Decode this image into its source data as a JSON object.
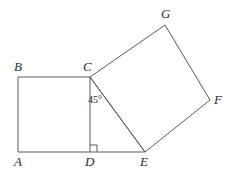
{
  "figure": {
    "background_color": "#ffffff",
    "stroke_color": "#5a5a5a",
    "label_color": "#2b2b2b",
    "stroke_width": 1,
    "canvas": {
      "width": 241,
      "height": 174
    },
    "vertices": [
      {
        "id": "A",
        "label": "A",
        "x": 18,
        "y": 152,
        "label_x": 14,
        "label_y": 155
      },
      {
        "id": "B",
        "label": "B",
        "x": 18,
        "y": 77,
        "label_x": 14,
        "label_y": 60
      },
      {
        "id": "C",
        "label": "C",
        "x": 90,
        "y": 77,
        "label_x": 83,
        "label_y": 60
      },
      {
        "id": "D",
        "label": "D",
        "x": 90,
        "y": 152,
        "label_x": 85,
        "label_y": 155
      },
      {
        "id": "E",
        "label": "E",
        "x": 145,
        "y": 152,
        "label_x": 140,
        "label_y": 155
      },
      {
        "id": "F",
        "label": "F",
        "x": 210,
        "y": 100,
        "label_x": 214,
        "label_y": 93
      },
      {
        "id": "G",
        "label": "G",
        "x": 165,
        "y": 25,
        "label_x": 161,
        "label_y": 7
      }
    ],
    "shapes": [
      {
        "name": "square-abcd",
        "type": "polygon",
        "points": "18,152 18,77 90,77 90,152"
      },
      {
        "name": "square-cgfe",
        "type": "polygon",
        "points": "90,77 165,25 210,100 145,152"
      },
      {
        "name": "segment-de",
        "type": "line",
        "x1": 90,
        "y1": 152,
        "x2": 145,
        "y2": 152
      },
      {
        "name": "segment-ce",
        "type": "line",
        "x1": 90,
        "y1": 77,
        "x2": 145,
        "y2": 152
      }
    ],
    "angle_marks": [
      {
        "name": "angle-45-at-c",
        "kind": "arc-label",
        "text": "45°",
        "label_x": 88,
        "label_y": 95
      },
      {
        "name": "right-angle-at-d",
        "kind": "right-angle-square",
        "points": "90,145 97,145 97,152",
        "size": 7
      }
    ]
  }
}
